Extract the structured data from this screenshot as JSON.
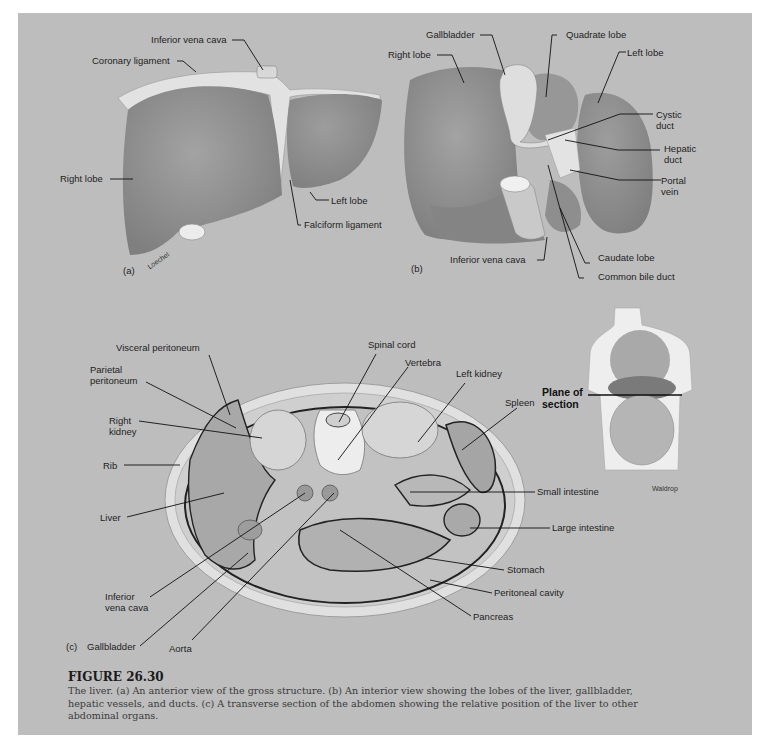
{
  "figure": {
    "number": "FIGURE 26.30",
    "caption_lines": [
      "The liver. (a) An anterior view of the gross structure. (b) An interior view showing the lobes of the liver, gallbladder,",
      "hepatic vessels, and ducts. (c) A transverse section of the abdomen showing the relative position of the liver to other",
      "abdominal organs."
    ]
  },
  "panel_a": {
    "tag": "(a)",
    "artist": "Loechel",
    "labels": {
      "inferior_vena_cava": "Inferior vena cava",
      "coronary_ligament": "Coronary ligament",
      "right_lobe": "Right lobe",
      "left_lobe": "Left lobe",
      "falciform_ligament": "Falciform ligament"
    }
  },
  "panel_b": {
    "tag": "(b)",
    "labels": {
      "gallbladder": "Gallbladder",
      "quadrate_lobe": "Quadrate lobe",
      "right_lobe": "Right lobe",
      "left_lobe": "Left lobe",
      "cystic_duct_1": "Cystic",
      "cystic_duct_2": "duct",
      "hepatic_duct_1": "Hepatic",
      "hepatic_duct_2": "duct",
      "portal_vein_1": "Portal",
      "portal_vein_2": "vein",
      "inferior_vena_cava": "Inferior vena cava",
      "caudate_lobe": "Caudate lobe",
      "common_bile_duct": "Common bile duct"
    }
  },
  "panel_c": {
    "tag": "(c)",
    "artist": "Waldrop",
    "plane_of_section_1": "Plane of",
    "plane_of_section_2": "section",
    "labels": {
      "visceral_peritoneum": "Visceral peritoneum",
      "parietal_peritoneum_1": "Parietal",
      "parietal_peritoneum_2": "peritoneum",
      "right_kidney_1": "Right",
      "right_kidney_2": "kidney",
      "rib": "Rib",
      "liver": "Liver",
      "inferior_vena_cava_1": "Inferior",
      "inferior_vena_cava_2": "vena cava",
      "gallbladder": "Gallbladder",
      "aorta": "Aorta",
      "spinal_cord": "Spinal cord",
      "vertebra": "Vertebra",
      "left_kidney": "Left kidney",
      "spleen": "Spleen",
      "small_intestine": "Small intestine",
      "large_intestine": "Large intestine",
      "stomach": "Stomach",
      "peritoneal_cavity": "Peritoneal cavity",
      "pancreas": "Pancreas"
    }
  },
  "colors": {
    "panel_bg": "#bdbdbd",
    "organ": "#8c8c8c",
    "organ_light": "#a6a6a6",
    "tissue_light": "#dcdcdc",
    "leader": "#111111"
  }
}
